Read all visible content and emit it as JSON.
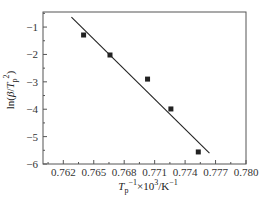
{
  "chart_data": {
    "type": "scatter",
    "title": "",
    "xlabel": "T_p^-1×10^3/K^-1",
    "ylabel": "ln(β/T_p^2)",
    "xlim": [
      0.76,
      0.78
    ],
    "ylim": [
      -6,
      -0.45
    ],
    "x_ticks": [
      "0.762",
      "0.765",
      "0.768",
      "0.771",
      "0.774",
      "0.777",
      "0.780"
    ],
    "y_ticks": [
      "-1",
      "-2",
      "-3",
      "-4",
      "-5",
      "-6"
    ],
    "grid": false,
    "legend": null,
    "series": [
      {
        "name": "data",
        "marker": "square",
        "color": "#222222",
        "x": [
          0.764,
          0.7666,
          0.7703,
          0.7726,
          0.7753
        ],
        "y": [
          -1.29,
          -2.02,
          -2.9,
          -3.99,
          -5.56
        ]
      },
      {
        "name": "linear fit",
        "type": "line",
        "color": "#222222",
        "x": [
          0.7628,
          0.7764
        ],
        "y": [
          -0.64,
          -5.6
        ]
      }
    ]
  },
  "labels": {
    "xlabel_main": "T",
    "xlabel_sub": "p",
    "xlabel_sup": "−1",
    "xlabel_rest": "×10",
    "xlabel_sup2": "3",
    "xlabel_unit": "/K",
    "xlabel_sup3": "−1",
    "ylabel": "ln(β/T  )"
  }
}
